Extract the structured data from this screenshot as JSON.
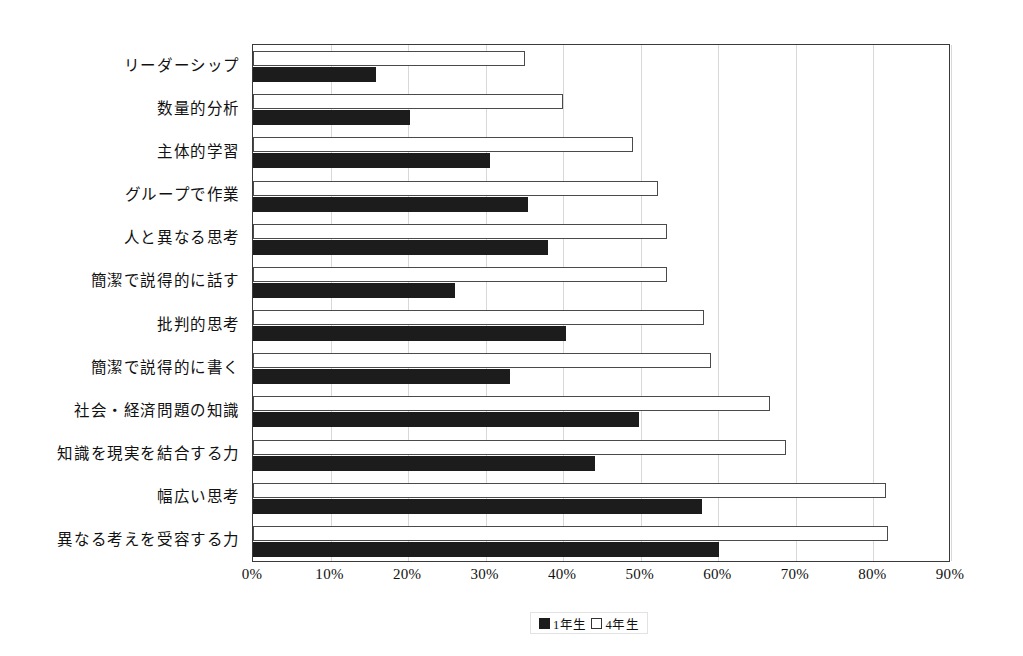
{
  "chart_data": {
    "type": "bar",
    "orientation": "horizontal",
    "title": "",
    "xlabel": "",
    "ylabel": "",
    "xlim": [
      0,
      90
    ],
    "xticks": [
      0,
      10,
      20,
      30,
      40,
      50,
      60,
      70,
      80,
      90
    ],
    "xtick_labels": [
      "0%",
      "10%",
      "20%",
      "30%",
      "40%",
      "50%",
      "60%",
      "70%",
      "80%",
      "90%"
    ],
    "grid": true,
    "grid_axis": "x",
    "legend_position": "bottom-center",
    "categories": [
      "リーダーシップ",
      "数量的分析",
      "主体的学習",
      "グループで作業",
      "人と異なる思考",
      "簡潔で説得的に話す",
      "批判的思考",
      "簡潔で説得的に書く",
      "社会・経済問題の知識",
      "知識を現実を結合する力",
      "幅広い思考",
      "異なる考えを受容する力"
    ],
    "series": [
      {
        "name": "1年生",
        "color": "#1c1c1c",
        "style": "filled",
        "values": [
          15.8,
          20.3,
          30.6,
          35.4,
          38.0,
          26.0,
          40.4,
          33.1,
          49.8,
          44.1,
          57.9,
          60.1
        ]
      },
      {
        "name": "4年生",
        "color": "#ffffff",
        "style": "hollow",
        "values": [
          35.1,
          40.0,
          49.0,
          52.2,
          53.4,
          53.4,
          58.2,
          59.0,
          66.7,
          68.7,
          81.6,
          81.9
        ]
      }
    ]
  },
  "legend": {
    "entries": [
      {
        "label": "1年生",
        "swatch": "filled"
      },
      {
        "label": "4年生",
        "swatch": "hollow"
      }
    ]
  }
}
